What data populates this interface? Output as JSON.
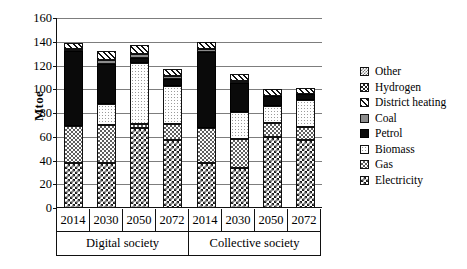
{
  "chart_data": {
    "type": "bar",
    "subtype": "stacked",
    "title": "",
    "xlabel": "",
    "ylabel": "Mtoe",
    "ylim": [
      0,
      160
    ],
    "ytick_step": 20,
    "yticks": [
      160,
      140,
      120,
      100,
      80,
      60,
      40,
      20,
      0
    ],
    "grid": true,
    "legend_position": "right",
    "groups": [
      "Digital society",
      "Collective society"
    ],
    "categories": [
      "2014",
      "2030",
      "2050",
      "2072",
      "2014",
      "2030",
      "2050",
      "2072"
    ],
    "series": [
      {
        "name": "Electricity",
        "values": [
          38,
          38,
          67,
          57,
          38,
          34,
          60,
          57
        ]
      },
      {
        "name": "Gas",
        "values": [
          31,
          32,
          4,
          14,
          29,
          24,
          12,
          11
        ]
      },
      {
        "name": "Biomass",
        "values": [
          0,
          18,
          51,
          32,
          0,
          23,
          14,
          23
        ]
      },
      {
        "name": "Petrol",
        "values": [
          63,
          33,
          4,
          6,
          64,
          24,
          8,
          5
        ]
      },
      {
        "name": "Coal",
        "values": [
          2,
          4,
          4,
          2,
          3,
          2,
          0,
          0
        ]
      },
      {
        "name": "District heating",
        "values": [
          5,
          7,
          7,
          6,
          6,
          6,
          6,
          5
        ]
      },
      {
        "name": "Hydrogen",
        "values": [
          0,
          0,
          0,
          0,
          0,
          0,
          0,
          0
        ]
      },
      {
        "name": "Other",
        "values": [
          0,
          0,
          0,
          0,
          0,
          0,
          0,
          0
        ]
      }
    ],
    "totals": [
      139,
      132,
      137,
      117,
      140,
      113,
      100,
      101
    ]
  },
  "legend": {
    "items": [
      {
        "label": "Other",
        "pattern": "other"
      },
      {
        "label": "Hydrogen",
        "pattern": "hydrogen"
      },
      {
        "label": "District heating",
        "pattern": "districtheating"
      },
      {
        "label": "Coal",
        "pattern": "coal"
      },
      {
        "label": "Petrol",
        "pattern": "petrol"
      },
      {
        "label": "Biomass",
        "pattern": "biomass"
      },
      {
        "label": "Gas",
        "pattern": "gas"
      },
      {
        "label": "Electricity",
        "pattern": "electricity"
      }
    ]
  },
  "axis": {
    "y_title": "Mtoe"
  }
}
